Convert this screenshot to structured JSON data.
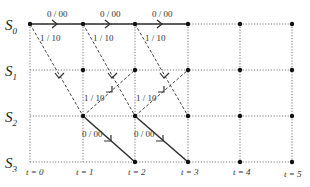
{
  "diagram": {
    "type": "trellis",
    "states": [
      {
        "name": "S",
        "sub": "0"
      },
      {
        "name": "S",
        "sub": "1"
      },
      {
        "name": "S",
        "sub": "2"
      },
      {
        "name": "S",
        "sub": "3"
      }
    ],
    "time_labels": [
      "t = 0",
      "t = 1",
      "t = 2",
      "t = 3",
      "t = 4",
      "t = 5"
    ],
    "edge_labels": {
      "s0_s0": "0 / 00",
      "s0_s2": "1 / 10",
      "s2_s1": "1 / 10",
      "s2_s3": "0 / 00"
    },
    "grid_x": [
      30,
      83,
      135,
      188,
      240,
      292
    ],
    "grid_y": [
      24,
      70,
      116,
      162
    ],
    "colors": {
      "solid": "#333333",
      "dashed": "#444444",
      "grid": "#777777"
    }
  }
}
